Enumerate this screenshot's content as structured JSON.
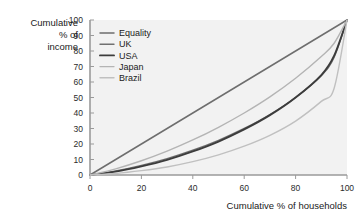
{
  "chart_data": {
    "type": "line",
    "title": "",
    "xlabel": "Cumulative % of households",
    "ylabel": "Cumulative % of income",
    "ylabel_lines": [
      "Cumulative",
      "% of",
      "income"
    ],
    "xlim": [
      0,
      100
    ],
    "ylim": [
      0,
      100
    ],
    "xticks": [
      0,
      20,
      40,
      60,
      80,
      100
    ],
    "yticks": [
      0,
      10,
      20,
      30,
      40,
      50,
      60,
      70,
      80,
      90,
      100
    ],
    "grid": false,
    "legend_position": "top-left-inside",
    "plot_background": "#f2f2f2",
    "axis_color": "#9a9a9a",
    "x": [
      0,
      10,
      20,
      30,
      40,
      50,
      60,
      70,
      80,
      90,
      95,
      100
    ],
    "series": [
      {
        "name": "Equality",
        "color": "#6e6e6e",
        "width": 1.5,
        "values": [
          0,
          10,
          20,
          30,
          40,
          50,
          60,
          70,
          80,
          90,
          95,
          100
        ]
      },
      {
        "name": "UK",
        "color": "#707070",
        "width": 1.4,
        "values": [
          0,
          2.6,
          6.2,
          10.6,
          16.0,
          22.4,
          30.0,
          39.0,
          50.0,
          64.0,
          76.0,
          100
        ]
      },
      {
        "name": "USA",
        "color": "#3c3c3c",
        "width": 1.9,
        "values": [
          0,
          2.2,
          5.6,
          9.8,
          15.2,
          21.6,
          29.4,
          38.6,
          50.0,
          64.5,
          77.0,
          100
        ]
      },
      {
        "name": "Japan",
        "color": "#b4b4b4",
        "width": 1.4,
        "values": [
          0,
          4.0,
          9.2,
          15.4,
          22.6,
          30.8,
          40.0,
          50.4,
          62.4,
          76.4,
          85.0,
          100
        ]
      },
      {
        "name": "Brazil",
        "color": "#c0c0c0",
        "width": 1.4,
        "values": [
          0,
          1.0,
          2.8,
          5.2,
          8.6,
          13.0,
          18.6,
          25.6,
          34.8,
          47.5,
          56.0,
          100
        ]
      }
    ]
  },
  "legend": {
    "items": [
      {
        "label": "Equality"
      },
      {
        "label": "UK"
      },
      {
        "label": "USA"
      },
      {
        "label": "Japan"
      },
      {
        "label": "Brazil"
      }
    ]
  }
}
